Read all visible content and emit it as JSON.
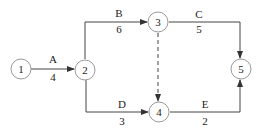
{
  "diagram": {
    "type": "activity-on-arrow network",
    "nodes": [
      {
        "id": "1",
        "label": "1"
      },
      {
        "id": "2",
        "label": "2"
      },
      {
        "id": "3",
        "label": "3"
      },
      {
        "id": "4",
        "label": "4"
      },
      {
        "id": "5",
        "label": "5"
      }
    ],
    "edges": [
      {
        "from": "1",
        "to": "2",
        "activity": "A",
        "duration": "4"
      },
      {
        "from": "2",
        "to": "3",
        "activity": "B",
        "duration": "6"
      },
      {
        "from": "3",
        "to": "5",
        "activity": "C",
        "duration": "5"
      },
      {
        "from": "2",
        "to": "4",
        "activity": "D",
        "duration": "3"
      },
      {
        "from": "4",
        "to": "5",
        "activity": "E",
        "duration": "2"
      },
      {
        "from": "3",
        "to": "4",
        "activity": "",
        "duration": "",
        "dummy": true
      }
    ]
  }
}
